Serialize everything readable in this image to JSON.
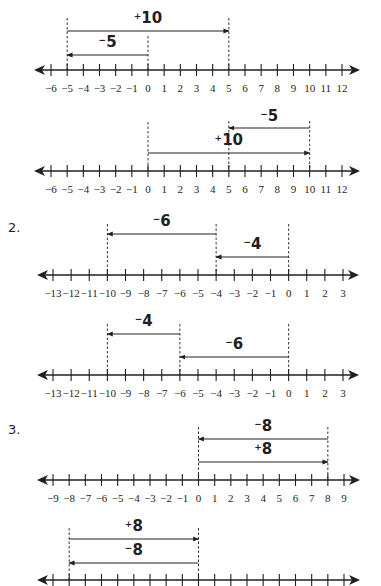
{
  "problems": [
    {
      "number": "",
      "number_lines": [
        {
          "axis": {
            "y": 70,
            "min": -6,
            "max": 12,
            "x_min": 51,
            "x_max": 342,
            "arrow_left": 34,
            "arrow_right": 360
          },
          "tick_labels": [
            "−6",
            "−5",
            "−4",
            "−3",
            "−2",
            "−1",
            "0",
            "1",
            "2",
            "3",
            "4",
            "5",
            "6",
            "7",
            "8",
            "9",
            "10",
            "11",
            "12"
          ],
          "guides": [
            {
              "value": -5,
              "top": 18
            },
            {
              "value": 0,
              "top": 36
            },
            {
              "value": 5,
              "top": 18
            }
          ],
          "jumps": [
            {
              "from": -5,
              "to": 5,
              "y": 31,
              "sign": "+",
              "magnitude": "10",
              "label_y": 23
            },
            {
              "from": 0,
              "to": -5,
              "y": 55,
              "sign": "−",
              "magnitude": "5",
              "label_y": 47
            }
          ]
        },
        {
          "axis": {
            "y": 171,
            "min": -6,
            "max": 12,
            "x_min": 51,
            "x_max": 342,
            "arrow_left": 34,
            "arrow_right": 360
          },
          "tick_labels": [
            "−6",
            "−5",
            "−4",
            "−3",
            "−2",
            "−1",
            "0",
            "1",
            "2",
            "3",
            "4",
            "5",
            "6",
            "7",
            "8",
            "9",
            "10",
            "11",
            "12"
          ],
          "guides": [
            {
              "value": 0,
              "top": 122
            },
            {
              "value": 5,
              "top": 121
            },
            {
              "value": 10,
              "top": 121
            }
          ],
          "jumps": [
            {
              "from": 10,
              "to": 5,
              "y": 128,
              "sign": "−",
              "magnitude": "5",
              "label_y": 121
            },
            {
              "from": 0,
              "to": 10,
              "y": 153,
              "sign": "+",
              "magnitude": "10",
              "label_y": 145
            }
          ]
        }
      ]
    },
    {
      "number": "2.",
      "number_lines": [
        {
          "axis": {
            "y": 275,
            "min": -13,
            "max": 3,
            "x_min": 53,
            "x_max": 343,
            "arrow_left": 37,
            "arrow_right": 359
          },
          "tick_labels": [
            "−13",
            "−12",
            "−11",
            "−10",
            "−9",
            "−8",
            "−7",
            "−6",
            "−5",
            "−4",
            "−3",
            "−2",
            "−1",
            "0",
            "1",
            "2",
            "3"
          ],
          "guides": [
            {
              "value": -10,
              "top": 224
            },
            {
              "value": -4,
              "top": 224
            },
            {
              "value": 0,
              "top": 224
            }
          ],
          "jumps": [
            {
              "from": -4,
              "to": -10,
              "y": 234,
              "sign": "−",
              "magnitude": "6",
              "label_y": 226
            },
            {
              "from": 0,
              "to": -4,
              "y": 257,
              "sign": "−",
              "magnitude": "4",
              "label_y": 249
            }
          ]
        },
        {
          "axis": {
            "y": 375,
            "min": -13,
            "max": 3,
            "x_min": 53,
            "x_max": 343,
            "arrow_left": 37,
            "arrow_right": 359
          },
          "tick_labels": [
            "−13",
            "−12",
            "−11",
            "−10",
            "−9",
            "−8",
            "−7",
            "−6",
            "−5",
            "−4",
            "−3",
            "−2",
            "−1",
            "0",
            "1",
            "2",
            "3"
          ],
          "guides": [
            {
              "value": -10,
              "top": 324
            },
            {
              "value": -6,
              "top": 324
            },
            {
              "value": 0,
              "top": 324
            }
          ],
          "jumps": [
            {
              "from": -6,
              "to": -10,
              "y": 334,
              "sign": "−",
              "magnitude": "4",
              "label_y": 326
            },
            {
              "from": 0,
              "to": -6,
              "y": 357,
              "sign": "−",
              "magnitude": "6",
              "label_y": 349
            }
          ]
        }
      ]
    },
    {
      "number": "3.",
      "number_lines": [
        {
          "axis": {
            "y": 480,
            "min": -9,
            "max": 9,
            "x_min": 53,
            "x_max": 344,
            "arrow_left": 37,
            "arrow_right": 360
          },
          "tick_labels": [
            "−9",
            "−8",
            "−7",
            "−6",
            "−5",
            "−4",
            "−3",
            "−2",
            "−1",
            "0",
            "1",
            "2",
            "3",
            "4",
            "5",
            "6",
            "7",
            "8",
            "9"
          ],
          "guides": [
            {
              "value": 0,
              "top": 427
            },
            {
              "value": 8,
              "top": 427
            }
          ],
          "jumps": [
            {
              "from": 8,
              "to": 0,
              "y": 439,
              "sign": "−",
              "magnitude": "8",
              "label_y": 431
            },
            {
              "from": 0,
              "to": 8,
              "y": 462,
              "sign": "+",
              "magnitude": "8",
              "label_y": 454
            }
          ]
        },
        {
          "axis": {
            "y": 580,
            "min": -9,
            "max": 9,
            "x_min": 53,
            "x_max": 344,
            "arrow_left": 37,
            "arrow_right": 360
          },
          "tick_labels": [],
          "guides": [
            {
              "value": -8,
              "top": 528
            },
            {
              "value": 0,
              "top": 528
            }
          ],
          "jumps": [
            {
              "from": -8,
              "to": 0,
              "y": 539,
              "sign": "+",
              "magnitude": "8",
              "label_y": 531
            },
            {
              "from": 0,
              "to": -8,
              "y": 563,
              "sign": "−",
              "magnitude": "8",
              "label_y": 555
            }
          ]
        }
      ]
    }
  ],
  "problem_number_positions": [
    {
      "x": 8,
      "y": 232
    },
    {
      "x": 8,
      "y": 434
    }
  ],
  "colors": {
    "ink": "#231f20",
    "background": "#ffffff"
  }
}
